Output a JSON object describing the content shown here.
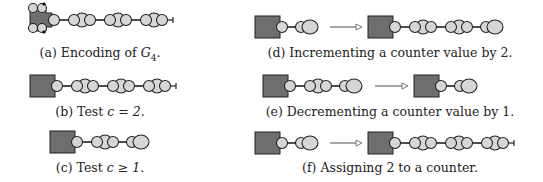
{
  "colors": {
    "block": "#6e6e6e",
    "node": "#d6d6d6",
    "stroke": "#222222",
    "edge": "#222222",
    "arrow": "#555555"
  },
  "captions": {
    "a": {
      "label": "(a)",
      "text": "Encoding of ",
      "math": "G",
      "sub": "4",
      "end": "."
    },
    "b": {
      "label": "(b)",
      "text": "Test ",
      "math": "c = 2",
      "end": "."
    },
    "c": {
      "label": "(c)",
      "text": "Test ",
      "math": "c ≥ 1",
      "end": "."
    },
    "d": {
      "label": "(d)",
      "text": "Incrementing a counter value by 2."
    },
    "e": {
      "label": "(e)",
      "text": "Decrementing a counter value by 1."
    },
    "f": {
      "label": "(f)",
      "text": "Assigning 2 to a counter."
    }
  },
  "panels": [
    {
      "id": "a",
      "caption_x": 100,
      "caption_y": 45,
      "figures": [
        {
          "x": 30,
          "y": 20,
          "gadget": "g4",
          "counters": 3,
          "terminal": true
        }
      ]
    },
    {
      "id": "b",
      "caption_x": 100,
      "caption_y": 104,
      "figures": [
        {
          "x": 30,
          "y": 86,
          "gadget": "box",
          "counters": 3,
          "terminal": true
        }
      ]
    },
    {
      "id": "c",
      "caption_x": 100,
      "caption_y": 160,
      "figures": [
        {
          "x": 50,
          "y": 142,
          "gadget": "box",
          "counters": 1,
          "terminal": false,
          "tail": true
        }
      ]
    },
    {
      "id": "d",
      "caption_x": 390,
      "caption_y": 45,
      "figures": [
        {
          "x": 255,
          "y": 27,
          "gadget": "box",
          "counters": 0,
          "tail": true
        },
        {
          "x": 368,
          "y": 27,
          "gadget": "box",
          "counters": 2,
          "terminal": false,
          "tail": true
        }
      ],
      "arrow": [
        330,
        27,
        362,
        27
      ]
    },
    {
      "id": "e",
      "caption_x": 390,
      "caption_y": 104,
      "figures": [
        {
          "x": 263,
          "y": 86,
          "gadget": "box",
          "counters": 1,
          "tail": true
        },
        {
          "x": 414,
          "y": 86,
          "gadget": "box",
          "counters": 0,
          "tail": true
        }
      ],
      "arrow": [
        375,
        86,
        408,
        86
      ]
    },
    {
      "id": "f",
      "caption_x": 390,
      "caption_y": 160,
      "figures": [
        {
          "x": 255,
          "y": 143,
          "gadget": "box",
          "counters": 0,
          "tail": true
        },
        {
          "x": 368,
          "y": 143,
          "gadget": "box",
          "counters": 3,
          "terminal": true
        }
      ],
      "arrow": [
        330,
        143,
        362,
        143
      ]
    }
  ]
}
